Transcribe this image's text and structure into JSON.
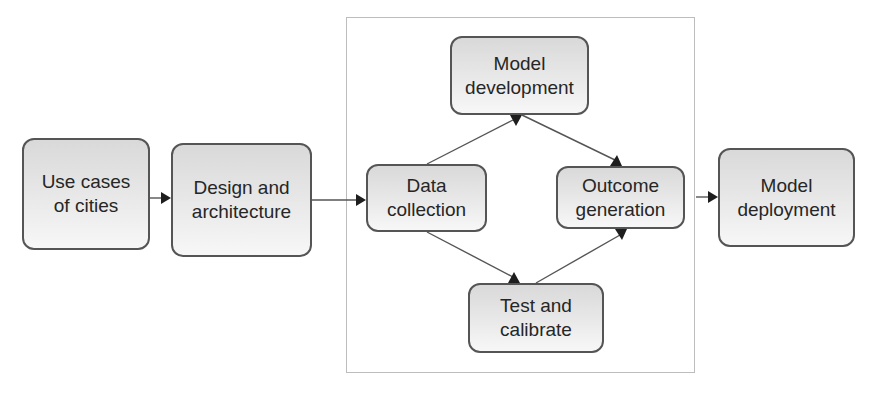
{
  "diagram": {
    "type": "flowchart",
    "nodes": [
      {
        "id": "use_cases",
        "label": "Use cases\nof cities"
      },
      {
        "id": "design",
        "label": "Design and\narchitecture"
      },
      {
        "id": "data_collection",
        "label": "Data\ncollection"
      },
      {
        "id": "model_development",
        "label": "Model\ndevelopment"
      },
      {
        "id": "outcome_generation",
        "label": "Outcome\ngeneration"
      },
      {
        "id": "test_calibrate",
        "label": "Test and\ncalibrate"
      },
      {
        "id": "model_deployment",
        "label": "Model\ndeployment"
      }
    ],
    "edges": [
      {
        "from": "use_cases",
        "to": "design"
      },
      {
        "from": "design",
        "to": "data_collection"
      },
      {
        "from": "data_collection",
        "to": "model_development"
      },
      {
        "from": "model_development",
        "to": "outcome_generation"
      },
      {
        "from": "data_collection",
        "to": "test_calibrate"
      },
      {
        "from": "test_calibrate",
        "to": "outcome_generation"
      },
      {
        "from": "outcome_generation",
        "to": "model_deployment"
      }
    ],
    "groups": [
      {
        "id": "iterative_loop",
        "members": [
          "data_collection",
          "model_development",
          "outcome_generation",
          "test_calibrate"
        ]
      }
    ],
    "colors": {
      "border": "#555555",
      "fill_top": "#d9d9d9",
      "fill_bottom": "#f7f7f7",
      "text": "#262626",
      "frame": "#bdbdbd"
    }
  }
}
